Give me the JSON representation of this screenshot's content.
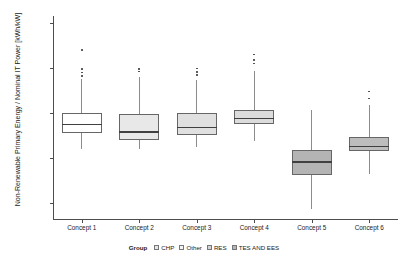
{
  "chart_data": {
    "type": "boxplot",
    "title": "",
    "xlabel": "",
    "ylabel": "Non-Renewable Primary Energy / Nominal IT Power [kWh/kW]",
    "ylim": [
      -13500,
      31500
    ],
    "yticks": [
      30000,
      20000,
      10000,
      0,
      -10000
    ],
    "ytick_labels": [
      "30000",
      "20000",
      "10000",
      "0",
      "-10000"
    ],
    "grid": false,
    "legend_position": "bottom",
    "legend_title": "Group",
    "categories": [
      "Concept 1",
      "Concept 2",
      "Concept 3",
      "Concept 4",
      "Concept 5",
      "Concept 6"
    ],
    "boxes": [
      {
        "category": "Concept 1",
        "group": "Other",
        "fill": "#ffffff",
        "whisker_low": 2000,
        "q1": 5500,
        "median": 7600,
        "q3": 10000,
        "whisker_high": 17500,
        "outliers": [
          18200,
          19000,
          19700,
          24000
        ]
      },
      {
        "category": "Concept 2",
        "group": "CHP",
        "fill": "#e8e8e8",
        "whisker_low": 2100,
        "q1": 4100,
        "median": 5900,
        "q3": 9700,
        "whisker_high": 17900,
        "outliers": [
          19200,
          19800
        ]
      },
      {
        "category": "Concept 3",
        "group": "CHP",
        "fill": "#e0e0e0",
        "whisker_low": 2400,
        "q1": 5100,
        "median": 6900,
        "q3": 9900,
        "whisker_high": 17300,
        "outliers": [
          18400,
          19100,
          19900
        ]
      },
      {
        "category": "Concept 4",
        "group": "RES",
        "fill": "#dcdcdc",
        "whisker_low": 3700,
        "q1": 7600,
        "median": 9000,
        "q3": 10700,
        "whisker_high": 19300,
        "outliers": [
          21000,
          21800,
          23000
        ]
      },
      {
        "category": "Concept 5",
        "group": "TES AND EES",
        "fill": "#b4b4b4",
        "whisker_low": -11200,
        "q1": -3700,
        "median": -700,
        "q3": 1800,
        "whisker_high": 10600,
        "outliers": []
      },
      {
        "category": "Concept 6",
        "group": "TES AND EES",
        "fill": "#bdbdbd",
        "whisker_low": -3500,
        "q1": 1500,
        "median": 2700,
        "q3": 4700,
        "whisker_high": 11700,
        "outliers": [
          13200,
          14800
        ]
      }
    ],
    "legend_entries": [
      {
        "label": "CHP",
        "color": "#e6e6e6"
      },
      {
        "label": "Other",
        "color": "#f5f5f5"
      },
      {
        "label": "RES",
        "color": "#d2d2d2"
      },
      {
        "label": "TES AND EES",
        "color": "#b4b4b4"
      }
    ]
  }
}
